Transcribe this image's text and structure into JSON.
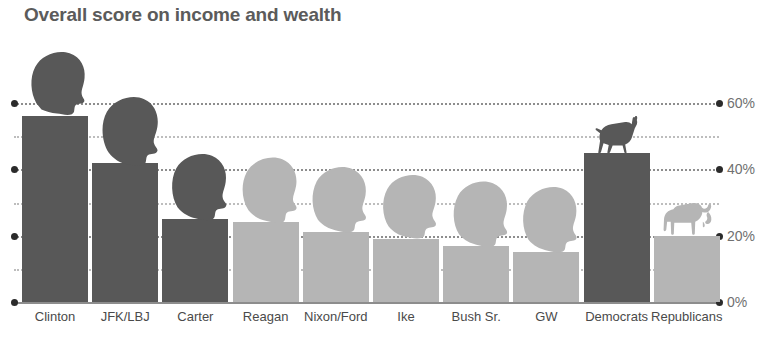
{
  "chart_data": {
    "type": "bar",
    "title": "Overall score on income and wealth",
    "xlabel": "",
    "ylabel": "",
    "ylim": [
      0,
      60
    ],
    "grid": true,
    "legend_position": "none",
    "categories": [
      "Clinton",
      "JFK/LBJ",
      "Carter",
      "Reagan",
      "Nixon/Ford",
      "Ike",
      "Bush Sr.",
      "GW",
      "Democrats",
      "Republicans"
    ],
    "values": [
      56,
      42,
      25,
      24,
      21,
      19,
      17,
      15,
      45,
      20
    ],
    "groups": [
      "Democrat",
      "Democrat",
      "Democrat",
      "Republican",
      "Republican",
      "Republican",
      "Republican",
      "Republican",
      "Democrat",
      "Republican"
    ],
    "ytick_labels": [
      "0%",
      "20%",
      "40%",
      "60%"
    ],
    "ytick_values": [
      0,
      20,
      40,
      60
    ],
    "minor_gridlines": [
      10,
      30,
      50
    ],
    "annotations": [
      {
        "category": "Democrats",
        "icon": "donkey-icon"
      },
      {
        "category": "Republicans",
        "icon": "elephant-icon"
      }
    ],
    "colors": {
      "democrat_bar": "#585858",
      "republican_bar": "#b5b5b5",
      "title_text": "#5b5b5b",
      "axis_text": "#707070",
      "label_text": "#4a4a4a",
      "gridline": "#8d8d8d"
    }
  },
  "axis": {
    "y_labels": [
      "60%",
      "40%",
      "20%",
      "0%"
    ]
  },
  "bars": [
    {
      "label": "Clinton",
      "value": 56,
      "party": "dem",
      "icon": "head-silhouette-clinton"
    },
    {
      "label": "JFK/LBJ",
      "value": 42,
      "party": "dem",
      "icon": "head-silhouette-jfk-lbj"
    },
    {
      "label": "Carter",
      "value": 25,
      "party": "dem",
      "icon": "head-silhouette-carter"
    },
    {
      "label": "Reagan",
      "value": 24,
      "party": "rep",
      "icon": "head-silhouette-reagan"
    },
    {
      "label": "Nixon/Ford",
      "value": 21,
      "party": "rep",
      "icon": "head-silhouette-nixon-ford"
    },
    {
      "label": "Ike",
      "value": 19,
      "party": "rep",
      "icon": "head-silhouette-ike"
    },
    {
      "label": "Bush Sr.",
      "value": 17,
      "party": "rep",
      "icon": "head-silhouette-bush-sr"
    },
    {
      "label": "GW",
      "value": 15,
      "party": "rep",
      "icon": "head-silhouette-gw"
    },
    {
      "label": "Democrats",
      "value": 45,
      "party": "dem",
      "icon": "donkey-icon"
    },
    {
      "label": "Republicans",
      "value": 20,
      "party": "rep",
      "icon": "elephant-icon"
    }
  ]
}
